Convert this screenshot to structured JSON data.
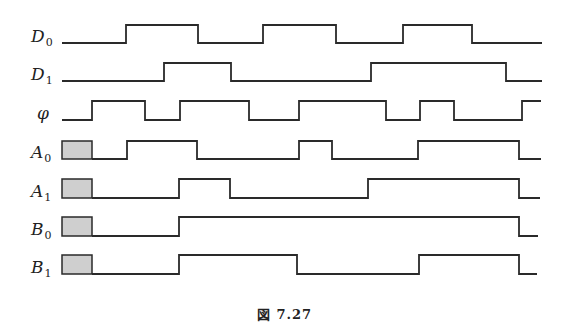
{
  "figure": {
    "caption": "図 7.27",
    "type": "timing-diagram"
  },
  "signals": [
    {
      "name": "D",
      "sub": "0",
      "label_y": 44,
      "high_y": 25,
      "low_y": 43,
      "unknown_until": null,
      "start_x": 62,
      "end_x": 542,
      "initial": 0,
      "transitions": [
        126,
        198,
        263,
        336,
        403,
        472
      ]
    },
    {
      "name": "D",
      "sub": "1",
      "label_y": 82,
      "high_y": 63,
      "low_y": 81,
      "unknown_until": null,
      "start_x": 62,
      "end_x": 542,
      "initial": 0,
      "transitions": [
        164,
        231,
        371,
        506
      ]
    },
    {
      "name": "φ",
      "sub": "",
      "label_y": 121,
      "high_y": 101,
      "low_y": 120,
      "unknown_until": null,
      "start_x": 62,
      "end_x": 541,
      "initial": 0,
      "transitions": [
        92,
        145,
        180,
        249,
        299,
        386,
        420,
        454,
        522
      ]
    },
    {
      "name": "A",
      "sub": "0",
      "label_y": 160,
      "high_y": 141,
      "low_y": 159,
      "unknown_until": 92,
      "start_x": 62,
      "end_x": 541,
      "initial": 0,
      "transitions": [
        127,
        197,
        299,
        332,
        418,
        519
      ]
    },
    {
      "name": "A",
      "sub": "1",
      "label_y": 199,
      "high_y": 179,
      "low_y": 198,
      "unknown_until": 92,
      "start_x": 62,
      "end_x": 540,
      "initial": 0,
      "transitions": [
        179,
        230,
        368,
        519
      ]
    },
    {
      "name": "B",
      "sub": "0",
      "label_y": 237,
      "high_y": 217,
      "low_y": 236,
      "unknown_until": 92,
      "start_x": 62,
      "end_x": 538,
      "initial": 0,
      "transitions": [
        179,
        519
      ]
    },
    {
      "name": "B",
      "sub": "1",
      "label_y": 275,
      "high_y": 255,
      "low_y": 274,
      "unknown_until": 92,
      "start_x": 62,
      "end_x": 537,
      "initial": 0,
      "transitions": [
        179,
        297,
        419,
        519
      ]
    }
  ],
  "colors": {
    "line": "#2a2a2a",
    "unknown_fill": "#cfcfcf",
    "background": "#ffffff"
  }
}
